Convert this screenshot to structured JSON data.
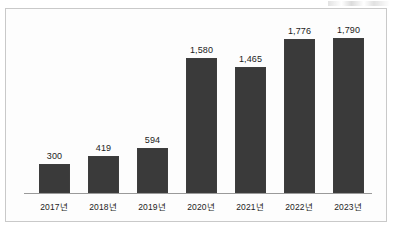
{
  "chart_data": {
    "type": "bar",
    "title": "",
    "subtitle": "",
    "xlabel": "",
    "ylabel": "",
    "categories": [
      "2017년",
      "2018년",
      "2019년",
      "2020년",
      "2021년",
      "2022년",
      "2023년"
    ],
    "values": [
      300,
      419,
      594,
      1580,
      1465,
      1776,
      1790
    ],
    "value_labels": [
      "300",
      "419",
      "594",
      "1,580",
      "1,465",
      "1,776",
      "1,790"
    ],
    "series": [
      {
        "name": "",
        "values": [
          300,
          419,
          594,
          1580,
          1465,
          1776,
          1790
        ]
      }
    ],
    "bar_color": "#3a3a3a",
    "grid": false,
    "legend": false,
    "axis_line_color": "#9a9a9a",
    "frame_border_color": "#c9c9c9",
    "background_color": "#fdfdfd",
    "ylim": [
      0,
      1900
    ]
  },
  "bars": [
    {
      "label": "2017년",
      "value_label": "300",
      "height_px": 29,
      "left_px": 33
    },
    {
      "label": "2018년",
      "value_label": "419",
      "height_px": 37,
      "left_px": 82
    },
    {
      "label": "2019년",
      "value_label": "594",
      "height_px": 45,
      "left_px": 131
    },
    {
      "label": "2020년",
      "value_label": "1,580",
      "height_px": 135,
      "left_px": 180
    },
    {
      "label": "2021년",
      "value_label": "1,465",
      "height_px": 126,
      "left_px": 229
    },
    {
      "label": "2022년",
      "value_label": "1,776",
      "height_px": 154,
      "left_px": 278
    },
    {
      "label": "2023년",
      "value_label": "1,790",
      "height_px": 155,
      "left_px": 327
    }
  ]
}
